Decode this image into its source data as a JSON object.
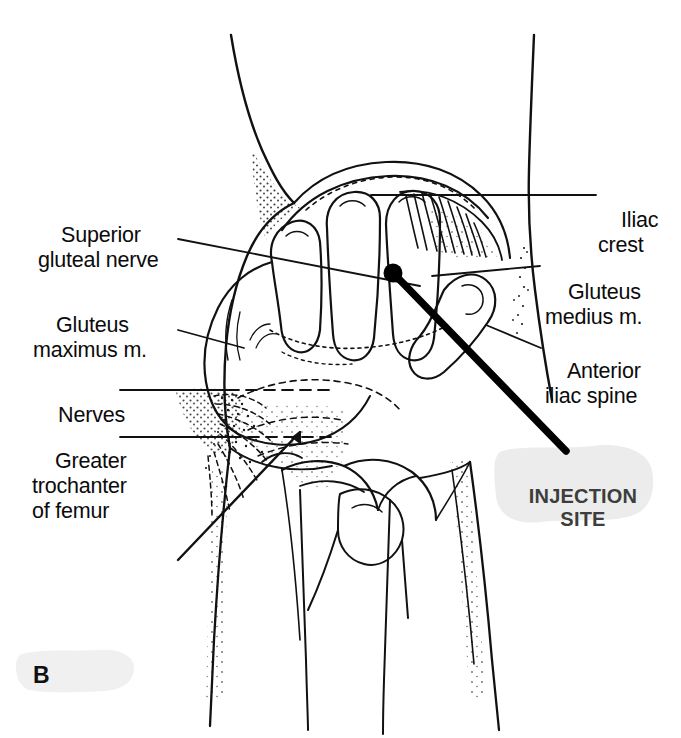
{
  "figure": {
    "panel_letter": "B",
    "background_color": "#ffffff",
    "ink_color": "#111111",
    "injection_marker_color": "#000000",
    "smudge_color": "#ececec"
  },
  "labels_left": [
    {
      "name": "superior-gluteal-nerve",
      "text": "Superior\ngluteal nerve",
      "x": 38,
      "y": 198
    },
    {
      "name": "gluteus-maximus",
      "text": "Gluteus\nmaximus m.",
      "x": 33,
      "y": 288
    },
    {
      "name": "nerves",
      "text": "Nerves",
      "x": 35,
      "y": 380
    },
    {
      "name": "greater-trochanter-of-femur",
      "text": "Greater\ntrochanter\nof femur",
      "x": 32,
      "y": 424
    }
  ],
  "labels_right": [
    {
      "name": "iliac-crest",
      "text": "Iliac\ncrest",
      "x": 598,
      "y": 180
    },
    {
      "name": "gluteus-medius",
      "text": "Gluteus\nmedius m.",
      "x": 545,
      "y": 255
    },
    {
      "name": "anterior-iliac-spine",
      "text": "Anterior\niliac spine",
      "x": 545,
      "y": 334
    }
  ],
  "injection_site": {
    "text": "INJECTION\nSITE",
    "marker_x": 393,
    "marker_y": 273,
    "marker_radius": 9
  },
  "anatomy": {
    "view": "Lateral hip — ventrogluteal injection site landmarks",
    "structures": [
      "iliac crest",
      "anterior iliac spine",
      "gluteus medius muscle",
      "gluteus maximus muscle",
      "superior gluteal nerve",
      "sciatic and gluteal nerves",
      "greater trochanter of femur",
      "clinician hand positioned on hip"
    ]
  }
}
